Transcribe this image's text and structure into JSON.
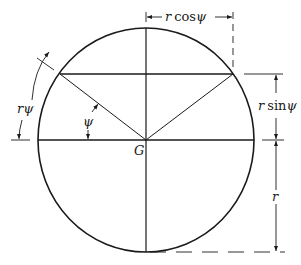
{
  "diagram": {
    "type": "geometry",
    "colors": {
      "stroke": "#1a1a1a",
      "background": "#ffffff"
    },
    "labels": {
      "center": "G",
      "angle": "ψ",
      "arc_length": "rψ",
      "half_chord": "r cosψ",
      "chord_height": "r sinψ",
      "radius": "r"
    },
    "label_parts": {
      "rcos_r": "r",
      "rcos_fn": "cos",
      "rcos_psi": "ψ",
      "rsin_r": "r",
      "rsin_fn": "sin",
      "rsin_psi": "ψ",
      "arc_r": "r",
      "arc_psi": "ψ"
    }
  }
}
